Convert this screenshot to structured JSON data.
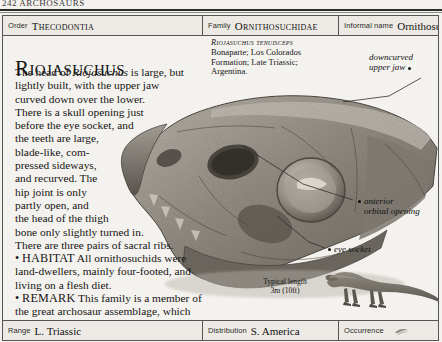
{
  "page": {
    "folio": "242  ARCHOSAURS"
  },
  "header": {
    "order_label": "Order",
    "order_value": "Thecodontia",
    "family_label": "Family",
    "family_value": "Ornithosuchidae",
    "informal_label": "Informal name",
    "informal_value": "Ornithosuchid"
  },
  "main": {
    "headline": "Riojasuchus",
    "description": [
      "The head of Riojasuchus is large, but",
      "lightly built, with the upper jaw",
      "curved down over the lower.",
      "There is a skull opening just",
      "before the eye socket, and",
      "the teeth are large,",
      "blade-like, com-",
      "pressed sideways,",
      "and recurved. The",
      "hip joint is only",
      "partly open, and",
      "the head of the thigh",
      "bone only slightly turned in.",
      "There are three pairs of sacral ribs."
    ],
    "italic_word": "Riojasuchus",
    "habitat_label": "HABITAT",
    "habitat_text": "All ornithosuchids were land-dwellers, mainly four-footed, and living on a flesh diet.",
    "remark_label": "REMARK",
    "remark_text": "This family is a member of the great archosaur assemblage, which includes dinosaurs, pterosaurs, and crocodiles.",
    "bullet_glyph": "•"
  },
  "specimen": {
    "species": "Riojasuchus tenuisceps",
    "lines": [
      "Bonaparte; Los Colorados",
      "Formation; Late Triassic;",
      "Argentina."
    ]
  },
  "annotations": [
    {
      "id": "downcurved-upper-jaw",
      "line1": "downcurved",
      "line2": "upper jaw"
    },
    {
      "id": "anterior-orbital-opening",
      "line1": "anterior",
      "line2": "orbital opening"
    },
    {
      "id": "eye-socket",
      "line1": "eye socket",
      "line2": ""
    }
  ],
  "scale": {
    "caption": "Typical length",
    "value": "3m (10ft)"
  },
  "footer": {
    "range_label": "Range",
    "range_value": "L. Triassic",
    "distribution_label": "Distribution",
    "distribution_value": "S. America",
    "occurrence_label": "Occurrence",
    "occurrence_icon": "abundance-icon"
  },
  "colors": {
    "page_bg": "#f4f2ee",
    "band_bg": "#edeae5",
    "rule": "#555555",
    "text": "#141414"
  }
}
